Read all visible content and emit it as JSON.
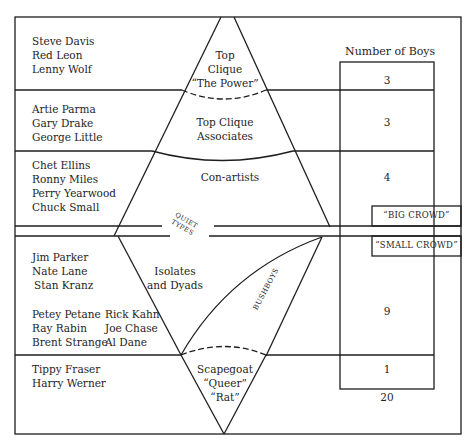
{
  "header": {
    "number_label": "Number of Boys"
  },
  "groups": [
    {
      "names": [
        "Steve Davis",
        "Red Leon",
        "Lenny Wolf"
      ],
      "label_lines": [
        "Top",
        "Clique",
        "“The Power”"
      ],
      "count": "3"
    },
    {
      "names": [
        "Artie Parma",
        "Gary Drake",
        "George Little"
      ],
      "label_lines": [
        "Top Clique",
        "Associates"
      ],
      "count": "3"
    },
    {
      "names": [
        "Chet Ellins",
        "Ronny Miles",
        "Perry Yearwood",
        "Chuck Small"
      ],
      "label_lines": [
        "Con-artists"
      ],
      "count": "4"
    },
    {
      "names": [
        "Jim Parker",
        "Nate Lane",
        "Stan Kranz"
      ],
      "names_col_a": [
        "Petey Petane",
        "Ray Rabin",
        "Brent Strange"
      ],
      "names_col_b": [
        "Rick Kahn",
        "Joe Chase",
        "Al Dane"
      ],
      "label_lines": [
        "Isolates",
        "and Dyads"
      ],
      "count": "9"
    },
    {
      "names": [
        "Tippy Fraser",
        "Harry Werner"
      ],
      "label_lines": [
        "Scapegoat",
        "“Queer”",
        "“Rat”"
      ],
      "count": "1"
    }
  ],
  "dividers": {
    "quiet_types": [
      "QUIET",
      "TYPES"
    ],
    "big_crowd": "“BIG CROWD”",
    "small_crowd": "“SMALL CROWD”",
    "bushboys": "BUSHBOYS"
  },
  "total": "20",
  "colors": {
    "ink": "#1e1e1e",
    "paper": "#ffffff"
  }
}
